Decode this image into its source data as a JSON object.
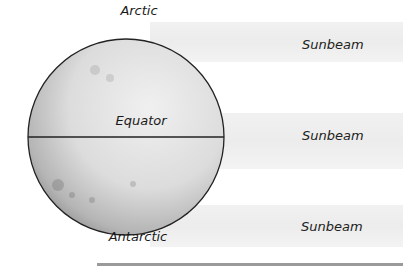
{
  "diagram": {
    "globe": {
      "labels": {
        "top": "Arctic",
        "middle": "Equator",
        "bottom": "Antarctic"
      }
    },
    "bands": [
      {
        "label": "Sunbeam"
      },
      {
        "label": "Sunbeam"
      },
      {
        "label": "Sunbeam"
      }
    ],
    "colors": {
      "outline": "#222222",
      "band": "#ededed",
      "rule": "#9a9a9a"
    }
  }
}
